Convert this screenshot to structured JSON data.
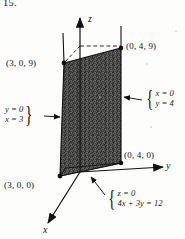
{
  "figure": {
    "problem_number": "15.",
    "type": "3d-coordinate-diagram",
    "axes": [
      {
        "name": "x-axis",
        "label": "x",
        "direction": "down-left"
      },
      {
        "name": "y-axis",
        "label": "y",
        "direction": "right"
      },
      {
        "name": "z-axis",
        "label": "z",
        "direction": "up"
      }
    ],
    "point_labels": [
      {
        "name": "point-3-0-9",
        "text": "(3, 0, 9)"
      },
      {
        "name": "point-0-4-9",
        "text": "(0, 4, 9)"
      },
      {
        "name": "point-0-4-0",
        "text": "(0, 4, 0)"
      },
      {
        "name": "point-3-0-0",
        "text": "(3, 0, 0)"
      }
    ],
    "annotations": [
      {
        "name": "right-face-equations",
        "lines": [
          "x = 0",
          "y = 4"
        ],
        "brace": "{",
        "arrow": "left"
      },
      {
        "name": "left-face-equations",
        "lines": [
          "y = 0",
          "x = 3"
        ],
        "brace": "}",
        "arrow": "right"
      },
      {
        "name": "base-plane-equations",
        "lines": [
          "z = 0",
          "4x + 3y = 12"
        ],
        "brace": "{",
        "arrow": "up-left"
      }
    ],
    "colors": {
      "ink": "#111111",
      "shading": "#5a5a56",
      "paper": "#fdfdfc"
    }
  }
}
